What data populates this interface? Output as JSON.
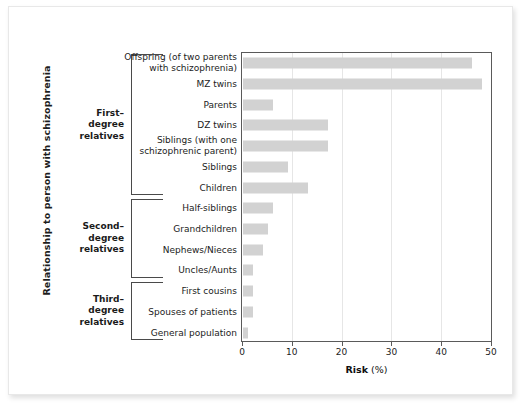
{
  "chart_data": {
    "type": "bar",
    "orientation": "horizontal",
    "title": "",
    "xlabel": "Risk (%)",
    "ylabel": "Relationship to person with schizophrenia",
    "xlim": [
      0,
      50
    ],
    "xticks": [
      0,
      10,
      20,
      30,
      40,
      50
    ],
    "grid": true,
    "legend": false,
    "bar_color": "#d2d2d2",
    "categories": [
      "Offspring (of two parents with schizophrenia)",
      "MZ twins",
      "Parents",
      "DZ twins",
      "Siblings (with one schizophrenic parent)",
      "Siblings",
      "Children",
      "Half-siblings",
      "Grandchildren",
      "Nephews/Nieces",
      "Uncles/Aunts",
      "First cousins",
      "Spouses  of patients",
      "General population"
    ],
    "values": [
      46,
      48,
      6,
      17,
      17,
      9,
      13,
      6,
      5,
      4,
      2,
      2,
      2,
      1
    ],
    "groups": [
      {
        "label": "First–\ndegree\nrelatives",
        "start_index": 0,
        "end_index": 6
      },
      {
        "label": "Second–\ndegree\nrelatives",
        "start_index": 7,
        "end_index": 10
      },
      {
        "label": "Third–\ndegree\nrelatives",
        "start_index": 11,
        "end_index": 13
      }
    ]
  },
  "axis": {
    "x_title_main": "Risk",
    "x_title_unit": "(%)",
    "y_title": "Relationship to person with schizophrenia"
  },
  "rows": [
    {
      "label_line1": "Offspring (of two parents",
      "label_line2": "with schizophrenia)",
      "value": 46
    },
    {
      "label_line1": "MZ twins",
      "label_line2": "",
      "value": 48
    },
    {
      "label_line1": "Parents",
      "label_line2": "",
      "value": 6
    },
    {
      "label_line1": "DZ twins",
      "label_line2": "",
      "value": 17
    },
    {
      "label_line1": "Siblings (with one",
      "label_line2": "schizophrenic parent)",
      "value": 17
    },
    {
      "label_line1": "Siblings",
      "label_line2": "",
      "value": 9
    },
    {
      "label_line1": "Children",
      "label_line2": "",
      "value": 13
    },
    {
      "label_line1": "Half-siblings",
      "label_line2": "",
      "value": 6
    },
    {
      "label_line1": "Grandchildren",
      "label_line2": "",
      "value": 5
    },
    {
      "label_line1": "Nephews/Nieces",
      "label_line2": "",
      "value": 4
    },
    {
      "label_line1": "Uncles/Aunts",
      "label_line2": "",
      "value": 2
    },
    {
      "label_line1": "First cousins",
      "label_line2": "",
      "value": 2
    },
    {
      "label_line1": "Spouses  of patients",
      "label_line2": "",
      "value": 2
    },
    {
      "label_line1": "General population",
      "label_line2": "",
      "value": 1
    }
  ],
  "groups": [
    {
      "line1": "First–",
      "line2": "degree",
      "line3": "relatives"
    },
    {
      "line1": "Second–",
      "line2": "degree",
      "line3": "relatives"
    },
    {
      "line1": "Third–",
      "line2": "degree",
      "line3": "relatives"
    }
  ],
  "xticks": [
    {
      "label": "0",
      "value": 0
    },
    {
      "label": "10",
      "value": 10
    },
    {
      "label": "20",
      "value": 20
    },
    {
      "label": "30",
      "value": 30
    },
    {
      "label": "40",
      "value": 40
    },
    {
      "label": "50",
      "value": 50
    }
  ]
}
